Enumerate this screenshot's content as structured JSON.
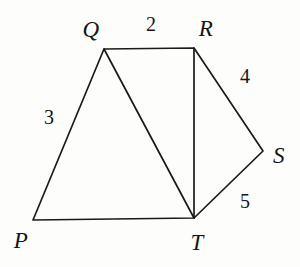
{
  "figure": {
    "background_color": "#fdfdfc",
    "stroke_color": "#1a1a1a",
    "vertices": [
      {
        "id": "P",
        "label": "P",
        "x": 33,
        "y": 220,
        "label_x": 21,
        "label_y": 240
      },
      {
        "id": "Q",
        "label": "Q",
        "x": 104,
        "y": 49,
        "label_x": 91,
        "label_y": 29
      },
      {
        "id": "R",
        "label": "R",
        "x": 194,
        "y": 48,
        "label_x": 206,
        "label_y": 28
      },
      {
        "id": "S",
        "label": "S",
        "x": 263,
        "y": 151,
        "label_x": 279,
        "label_y": 155
      },
      {
        "id": "T",
        "label": "T",
        "x": 194,
        "y": 218,
        "label_x": 197,
        "label_y": 242
      }
    ],
    "edges": [
      {
        "id": "PQ",
        "from": "P",
        "to": "Q",
        "length_label": "3"
      },
      {
        "id": "QR",
        "from": "Q",
        "to": "R",
        "length_label": "2"
      },
      {
        "id": "QT",
        "from": "Q",
        "to": "T",
        "length_label": ""
      },
      {
        "id": "RT",
        "from": "R",
        "to": "T",
        "length_label": ""
      },
      {
        "id": "RS",
        "from": "R",
        "to": "S",
        "length_label": "4"
      },
      {
        "id": "ST",
        "from": "S",
        "to": "T",
        "length_label": "5"
      },
      {
        "id": "PT",
        "from": "P",
        "to": "T",
        "length_label": ""
      }
    ],
    "length_labels": [
      {
        "id": "len-2",
        "edge": "QR",
        "text": "2",
        "x": 151,
        "y": 24
      },
      {
        "id": "len-3",
        "edge": "PQ",
        "text": "3",
        "x": 49,
        "y": 117
      },
      {
        "id": "len-4",
        "edge": "RS",
        "text": "4",
        "x": 245,
        "y": 76
      },
      {
        "id": "len-5",
        "edge": "ST",
        "text": "5",
        "x": 245,
        "y": 201
      }
    ],
    "paths": {
      "outline": "M 33 220 L 104 49 L 194 48 L 263 151 L 194 218 Z",
      "diagonal_QT": "M 104 49 L 194 218",
      "segment_RT": "M 194 48 L 194 218"
    }
  }
}
